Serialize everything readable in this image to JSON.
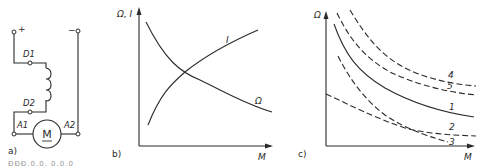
{
  "panel_a": {
    "label": "a)",
    "terminals": {
      "plus": "+",
      "minus": "−"
    },
    "nodes": {
      "d1": "D1",
      "d2": "D2",
      "a1": "A1",
      "a2": "A2"
    },
    "motor_symbol": "M"
  },
  "panel_b": {
    "label": "b)",
    "y_axis_label": "Ω, I",
    "x_axis_label": "M",
    "curve_labels": {
      "current": "I",
      "speed": "Ω"
    }
  },
  "panel_c": {
    "label": "c)",
    "y_axis_label": "Ω",
    "x_axis_label": "M",
    "curve_labels": [
      "4",
      "5",
      "1",
      "2",
      "3"
    ]
  },
  "caption": "ĐĐĐ.0.0. 0.0.0"
}
